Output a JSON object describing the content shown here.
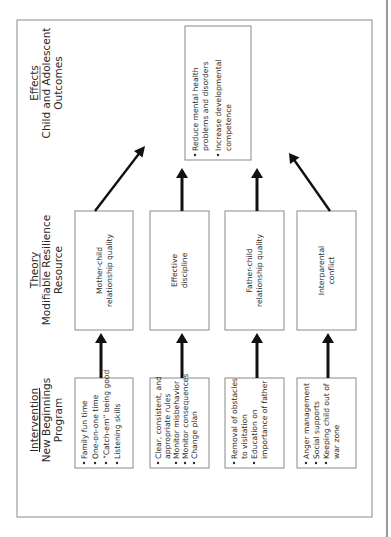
{
  "headers": {
    "intervention": {
      "title": "Intervention",
      "line1": "New Beginnings",
      "line2": "Program"
    },
    "theory": {
      "title": "Theory",
      "line1": "Modifiable Resilience",
      "line2": "Resource"
    },
    "effects": {
      "title": "Effects",
      "line1": "Child and Adolescent",
      "line2": "Outcomes"
    }
  },
  "interventions": [
    {
      "lines": [
        {
          "bullet": true,
          "text": "Family fun time"
        },
        {
          "bullet": true,
          "text": "One-on-one time"
        },
        {
          "bullet": true,
          "text": "“Catch-em” being good"
        },
        {
          "bullet": true,
          "text": "Listening skills"
        }
      ]
    },
    {
      "lines": [
        {
          "bullet": true,
          "text": "Clear, consistent, and"
        },
        {
          "bullet": false,
          "text": "appropriate rules"
        },
        {
          "bullet": true,
          "text": "Monitor misbehavior"
        },
        {
          "bullet": true,
          "text": "Monitor consequences"
        },
        {
          "bullet": true,
          "text": "Change plan"
        }
      ]
    },
    {
      "lines": [
        {
          "bullet": true,
          "text": "Removal of obstacles"
        },
        {
          "bullet": false,
          "text": "to visitation"
        },
        {
          "bullet": true,
          "text": "Education on"
        },
        {
          "bullet": false,
          "text": "importance of father"
        }
      ]
    },
    {
      "lines": [
        {
          "bullet": true,
          "text": "Anger management"
        },
        {
          "bullet": true,
          "text": "Social supports"
        },
        {
          "bullet": true,
          "text": "Keeping child out of"
        },
        {
          "bullet": false,
          "text": "war zone"
        }
      ]
    }
  ],
  "resources": [
    {
      "line1": "Mother-child",
      "line2": "relationship quality"
    },
    {
      "line1": "Effective",
      "line2": "discipline"
    },
    {
      "line1": "Father-child",
      "line2": "relationship quality"
    },
    {
      "line1": "Interparental",
      "line2": "conflict"
    }
  ],
  "outcomes": {
    "lines": [
      {
        "bullet": true,
        "text": "Reduce mental health"
      },
      {
        "bullet": false,
        "text": "problems and disorders"
      },
      {
        "bullet": true,
        "text": "Increase developmental"
      },
      {
        "bullet": false,
        "text": "competence"
      }
    ]
  }
}
